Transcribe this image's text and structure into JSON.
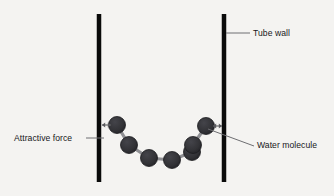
{
  "figure": {
    "type": "diagram",
    "background_color": "#f4f3f1"
  },
  "labels": {
    "tube_wall": "Tube wall",
    "attractive_force": "Attractive force",
    "water_molecule": "Water molecule"
  },
  "colors": {
    "wall": "#0a0a0a",
    "molecule_fill": "#323236",
    "molecule_stroke": "#1c1c1f",
    "bond": "#8f8f93",
    "leader_line": "#6e6e72",
    "arrow": "#5a5a5e",
    "text": "#17171a"
  },
  "walls": [
    {
      "name": "left-tube-wall",
      "x": 99,
      "y_top": 14,
      "y_bottom": 182,
      "thickness": 4.5
    },
    {
      "name": "right-tube-wall",
      "x": 224,
      "y_top": 14,
      "y_bottom": 182,
      "thickness": 4.5
    }
  ],
  "molecules": [
    {
      "index": 1,
      "cx": 117,
      "cy": 125,
      "r": 8.5
    },
    {
      "index": 2,
      "cx": 129,
      "cy": 145,
      "r": 8.5
    },
    {
      "index": 3,
      "cx": 149,
      "cy": 158,
      "r": 8.5
    },
    {
      "index": 4,
      "cx": 172,
      "cy": 160,
      "r": 8.5
    },
    {
      "index": 5,
      "cx": 192,
      "cy": 152,
      "r": 8.5
    },
    {
      "index": 6,
      "cx": 193,
      "cy": 145,
      "r": 8.5
    },
    {
      "index": 7,
      "cx": 206,
      "cy": 126,
      "r": 8.5
    }
  ],
  "bonds": [
    {
      "from": 1,
      "to": 2
    },
    {
      "from": 2,
      "to": 3
    },
    {
      "from": 3,
      "to": 4
    },
    {
      "from": 4,
      "to": 5
    },
    {
      "from": 5,
      "to": 6
    },
    {
      "from": 6,
      "to": 7
    }
  ],
  "force_arrows": [
    {
      "name": "left-attractive-force-arrow",
      "x1": 102,
      "y1": 125,
      "x2": 111,
      "y2": 125
    },
    {
      "name": "right-attractive-force-arrow",
      "x1": 213,
      "y1": 126,
      "x2": 222,
      "y2": 126
    }
  ],
  "leader_lines": [
    {
      "name": "tube-wall-leader",
      "x1": 226,
      "y1": 33,
      "x2": 250,
      "y2": 33
    },
    {
      "name": "attractive-force-leader",
      "x1": 86,
      "y1": 138,
      "x2": 104,
      "y2": 138
    },
    {
      "name": "water-molecule-leader",
      "x1": 208,
      "y1": 129,
      "x2": 254,
      "y2": 146
    }
  ]
}
